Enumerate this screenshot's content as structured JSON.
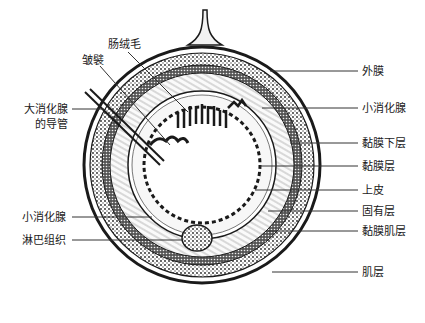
{
  "diagram": {
    "type": "cross-section",
    "colors": {
      "ink": "#1a1a1a",
      "background": "#ffffff"
    },
    "labels_right": [
      {
        "text": "外膜",
        "y": 71
      },
      {
        "text": "小消化腺",
        "y": 108
      },
      {
        "text": "黏膜下层",
        "y": 143
      },
      {
        "text": "黏膜层",
        "y": 166
      },
      {
        "text": "上皮",
        "y": 190
      },
      {
        "text": "固有层",
        "y": 211
      },
      {
        "text": "黏膜肌层",
        "y": 231
      },
      {
        "text": "肌层",
        "y": 272
      }
    ],
    "labels_left": {
      "villi": "肠绒毛",
      "plica": "皱襞",
      "large_gland_duct_line1": "大消化腺",
      "large_gland_duct_line2": "的导管",
      "small_gland": "小消化腺",
      "lymphoid": "淋巴组织"
    }
  }
}
